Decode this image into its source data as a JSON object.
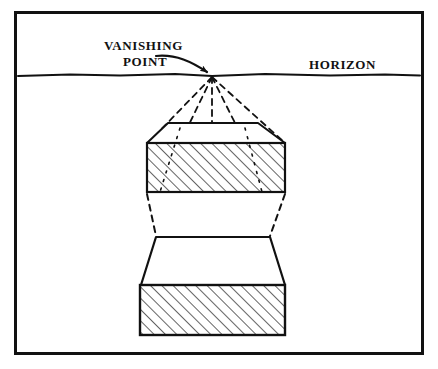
{
  "figure": {
    "background_color": "#ffffff",
    "ink_color": "#111111",
    "frame": {
      "name": "figure-border",
      "x": 14,
      "y": 11,
      "width": 410,
      "height": 344,
      "stroke_width": 3
    }
  },
  "labels": {
    "vanishing_point_line1": "VANISHING",
    "vanishing_point_line2": "POINT",
    "horizon": "HORIZON"
  },
  "horizon_line": {
    "name": "horizon-line",
    "y": 75,
    "x_start": 18,
    "x_end": 420,
    "stroke_width": 2
  },
  "vanishing_point": {
    "name": "vanishing-point",
    "x": 212,
    "y": 76
  },
  "upper_slab": {
    "name": "upper-slab",
    "top_face": {
      "top_left_x": 168,
      "top_right_x": 258,
      "top_y": 123,
      "bottom_left_x": 148,
      "bottom_right_x": 285,
      "bottom_y": 143
    },
    "front_face": {
      "left_x": 147,
      "right_x": 285,
      "top_y": 143,
      "bottom_y": 192,
      "hatched": true
    }
  },
  "lower_slab": {
    "name": "lower-slab",
    "top_face": {
      "top_left_x": 155,
      "top_right_x": 270,
      "top_y": 237,
      "bottom_left_x": 141,
      "bottom_right_x": 285,
      "bottom_y": 285
    },
    "front_face": {
      "left_x": 140,
      "right_x": 285,
      "top_y": 285,
      "bottom_y": 335,
      "hatched": true
    }
  },
  "perspective_rays": [
    {
      "name": "ray-outer-left",
      "x2": 148,
      "y2": 143
    },
    {
      "name": "ray-inner-left",
      "x2": 180,
      "y2": 143
    },
    {
      "name": "ray-center",
      "x2": 212,
      "y2": 143
    },
    {
      "name": "ray-inner-right",
      "x2": 245,
      "y2": 143
    },
    {
      "name": "ray-outer-right",
      "x2": 285,
      "y2": 143
    }
  ],
  "connector_rays": [
    {
      "name": "connector-left",
      "x1": 147,
      "y1": 192,
      "x2": 155,
      "y2": 237
    },
    {
      "name": "connector-right",
      "x1": 285,
      "y1": 192,
      "x2": 270,
      "y2": 237
    }
  ],
  "pointer_arrow": {
    "name": "vanishing-point-arrow",
    "from_x": 156,
    "from_y": 56,
    "to_x": 209,
    "to_y": 73
  },
  "hatching": {
    "angle_degrees": 45,
    "spacing_px": 8,
    "stroke_width": 1.3
  }
}
